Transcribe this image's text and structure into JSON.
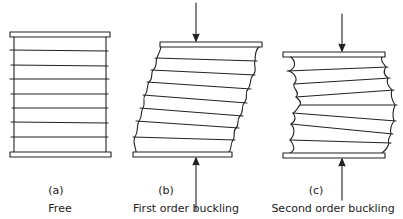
{
  "panels": [
    {
      "id": "a",
      "letter": "(a)",
      "caption": "Free",
      "top_plate": {
        "x": 10,
        "y": 32,
        "w": 100,
        "h": 5
      },
      "bottom_plate": {
        "x": 10,
        "y": 152,
        "w": 101,
        "h": 5
      },
      "load_arrows": false
    },
    {
      "id": "b",
      "letter": "(b)",
      "caption": "First order buckling",
      "top_plate": {
        "x": 160,
        "y": 42,
        "w": 102,
        "h": 5
      },
      "bottom_plate": {
        "x": 133,
        "y": 152,
        "w": 99,
        "h": 5
      },
      "load_arrows": true
    },
    {
      "id": "c",
      "letter": "(c)",
      "caption": "Second order buckling",
      "top_plate": {
        "x": 283,
        "y": 52,
        "w": 102,
        "h": 5
      },
      "bottom_plate": {
        "x": 283,
        "y": 153,
        "w": 102,
        "h": 5
      },
      "load_arrows": true
    }
  ],
  "colors": {
    "line": "#222222",
    "background": "#ffffff"
  }
}
